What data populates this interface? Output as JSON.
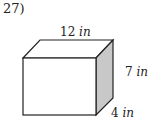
{
  "problem_number": "27)",
  "shape": "rectangular-prism",
  "dimensions": {
    "length": {
      "value": "12",
      "unit": "in"
    },
    "height": {
      "value": "7",
      "unit": "in"
    },
    "width": {
      "value": "4",
      "unit": "in"
    }
  },
  "colors": {
    "stroke": "#222222",
    "side_face": "#c8c8c8",
    "face": "#ffffff"
  }
}
